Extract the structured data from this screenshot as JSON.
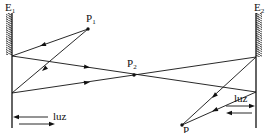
{
  "diagram": {
    "type": "optics-two-mirrors-light-reversibility",
    "mirrors": [
      {
        "id": "E1",
        "label": "E",
        "subscript": "1",
        "x": 12,
        "hatch_top": 13,
        "hatch_bottom": 55,
        "line_bottom": 128,
        "hatch_side": "left"
      },
      {
        "id": "E2",
        "label": "E",
        "subscript": "2",
        "x": 256,
        "hatch_top": 13,
        "hatch_bottom": 57,
        "line_bottom": 128,
        "hatch_side": "right"
      }
    ],
    "points": [
      {
        "id": "P1",
        "label": "P",
        "subscript": "1",
        "x": 88,
        "y": 29
      },
      {
        "id": "P2",
        "label": "P",
        "subscript": "2",
        "x": 134,
        "y": 75
      },
      {
        "id": "P3",
        "label": "P",
        "subscript": "",
        "x": 182,
        "y": 125
      }
    ],
    "rays": [
      {
        "from": [
          88,
          29
        ],
        "to": [
          12,
          56
        ]
      },
      {
        "from": [
          88,
          29
        ],
        "to": [
          12,
          93
        ]
      },
      {
        "from": [
          12,
          56
        ],
        "to": [
          256,
          92
        ]
      },
      {
        "from": [
          12,
          93
        ],
        "to": [
          256,
          57
        ]
      },
      {
        "from": [
          256,
          57
        ],
        "to": [
          182,
          125
        ]
      },
      {
        "from": [
          256,
          92
        ],
        "to": [
          182,
          125
        ]
      }
    ],
    "light_indicators": [
      {
        "side": "left",
        "label": "luz"
      },
      {
        "side": "right",
        "label": "luz"
      }
    ]
  },
  "labels": {
    "E1": "E",
    "E1_sub": "1",
    "E2": "E",
    "E2_sub": "2",
    "P1": "P",
    "P1_sub": "1",
    "P2": "P",
    "P2_sub": "2",
    "P3": "P",
    "luz_left": "luz",
    "luz_right": "luz"
  }
}
